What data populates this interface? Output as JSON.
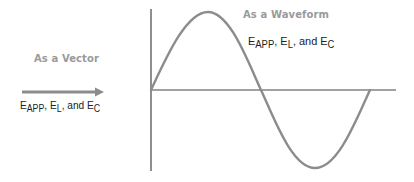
{
  "vector_panel": {
    "heading": "As a Vector",
    "label": {
      "parts": [
        {
          "main": "E",
          "sub": "APP"
        },
        {
          "sep": ", "
        },
        {
          "main": "E",
          "sub": "L"
        },
        {
          "sep": ", and "
        },
        {
          "main": "E",
          "sub": "C"
        }
      ]
    },
    "arrow_color": "#8c8c8c"
  },
  "waveform_panel": {
    "heading": "As a Waveform",
    "label": {
      "parts": [
        {
          "main": "E",
          "sub": "APP"
        },
        {
          "sep": ", "
        },
        {
          "main": "E",
          "sub": "L"
        },
        {
          "sep": ", and "
        },
        {
          "main": "E",
          "sub": "C"
        }
      ]
    },
    "axis_color": "#444444",
    "curve_color": "#8c8c8c",
    "waveform": {
      "type": "sine",
      "cycles": 1,
      "start_phase_deg": 0
    }
  },
  "strings": {
    "v_E1": "E",
    "v_S1": "APP",
    "v_sep1": ", ",
    "v_E2": "E",
    "v_S2": "L",
    "v_sep2": ", and ",
    "v_E3": "E",
    "v_S3": "C",
    "w_E1": "E",
    "w_S1": "APP",
    "w_sep1": ", ",
    "w_E2": "E",
    "w_S2": "L",
    "w_sep2": ", and ",
    "w_E3": "E",
    "w_S3": "C"
  }
}
